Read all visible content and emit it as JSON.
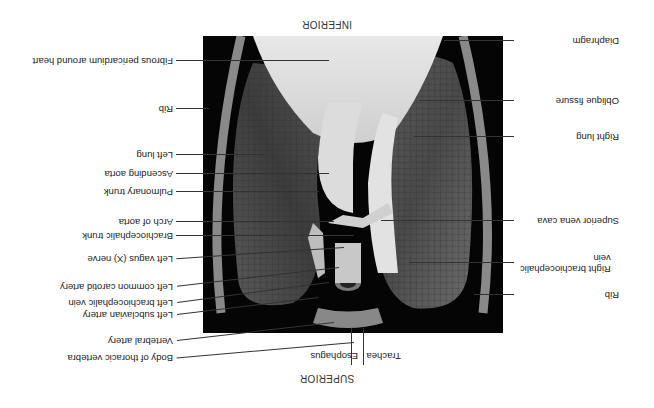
{
  "figure": {
    "orientation_top": "SUPERIOR",
    "orientation_bottom": "INFERIOR",
    "rotation_deg": 180
  },
  "labels_left": [
    {
      "text": "Right brachiocephalic",
      "text2": "vein",
      "y": 145
    },
    {
      "text": "Superior vena cava",
      "y": 187
    },
    {
      "text": "Right lung",
      "y": 271
    },
    {
      "text": "Oblique fissure",
      "y": 307
    },
    {
      "text": "Diaphragm",
      "y": 367
    },
    {
      "text": "Rib",
      "y": 113
    }
  ],
  "labels_right": [
    {
      "text": "Body of thoracic vertebra",
      "y": 50
    },
    {
      "text": "Vertebral artery",
      "y": 67
    },
    {
      "text": "Left subclavian artery",
      "y": 93
    },
    {
      "text": "Left brachiocephalic vein",
      "y": 105
    },
    {
      "text": "Left common carotid artery",
      "y": 121
    },
    {
      "text": "Left vagus (X) nerve",
      "y": 149
    },
    {
      "text": "Brachiocephalic trunk",
      "y": 172
    },
    {
      "text": "Arch of aorta",
      "y": 186
    },
    {
      "text": "Pulmonary trunk",
      "y": 216
    },
    {
      "text": "Ascending aorta",
      "y": 234
    },
    {
      "text": "Left lung",
      "y": 253
    },
    {
      "text": "Rib",
      "y": 299
    },
    {
      "text": "Fibrous pericardium around heart",
      "y": 347
    }
  ],
  "labels_bottom_top": [
    {
      "text": "Trachea"
    },
    {
      "text": "Esophagus"
    }
  ]
}
